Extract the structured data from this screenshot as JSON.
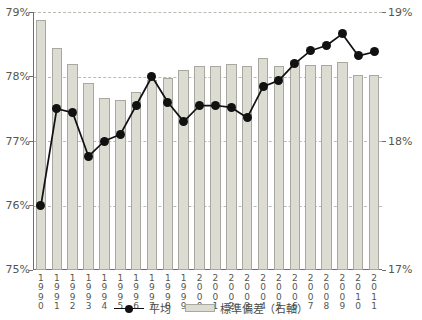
{
  "chart_data": {
    "type": "bar",
    "title": "",
    "xlabel": "",
    "ylabel": "",
    "grid": true,
    "legend_position": "bottom-center",
    "categories": [
      "1990",
      "1991",
      "1992",
      "1993",
      "1994",
      "1995",
      "1996",
      "1997",
      "1998",
      "1999",
      "2000",
      "2001",
      "2002",
      "2003",
      "2004",
      "2005",
      "2006",
      "2007",
      "2008",
      "2009",
      "2010",
      "2011"
    ],
    "left_axis": {
      "ticks": [
        "75%",
        "76%",
        "77%",
        "78%",
        "79%"
      ],
      "values": [
        75,
        76,
        77,
        78,
        79
      ],
      "ylim": [
        75,
        79
      ],
      "unit": "%"
    },
    "right_axis": {
      "ticks": [
        "17%",
        "18%",
        "19%"
      ],
      "values": [
        17,
        18,
        19
      ],
      "ylim": [
        17,
        19
      ],
      "unit": "%"
    },
    "series": [
      {
        "name": "平均",
        "type": "line",
        "axis": "left",
        "marker": "circle",
        "color": "#111111",
        "values": [
          76.0,
          77.5,
          77.44,
          76.76,
          77.0,
          77.1,
          77.55,
          78.0,
          77.6,
          77.3,
          77.55,
          77.55,
          77.52,
          77.36,
          77.84,
          77.94,
          78.2,
          78.4,
          78.48,
          78.66,
          78.32,
          78.38
        ]
      },
      {
        "name": "標準偏差（右軸）",
        "type": "bar",
        "axis": "right",
        "color": "#dcdcd2",
        "values": [
          18.94,
          18.72,
          18.6,
          18.45,
          18.33,
          18.32,
          18.38,
          18.47,
          18.49,
          18.55,
          18.58,
          18.58,
          18.6,
          18.58,
          18.64,
          18.58,
          18.62,
          18.59,
          18.59,
          18.61,
          18.51,
          18.51
        ]
      }
    ],
    "legend": [
      {
        "label": "平均",
        "marker": "line-with-dot"
      },
      {
        "label": "標準偏差（右軸）",
        "marker": "bar-swatch"
      }
    ]
  }
}
